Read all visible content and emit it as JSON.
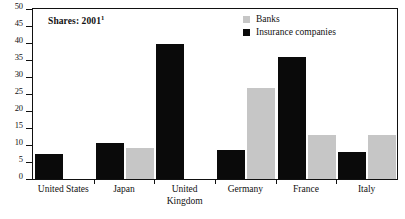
{
  "chart_data": {
    "type": "bar",
    "title": "Shares: 2001",
    "title_superscript": "1",
    "xlabel": "",
    "ylabel": "",
    "ylim": [
      0,
      50
    ],
    "ytick_step": 5,
    "yticks": [
      50,
      45,
      40,
      35,
      30,
      25,
      20,
      15,
      10,
      5,
      0
    ],
    "grid": false,
    "legend_position": "top-right",
    "categories": [
      "United States",
      "Japan",
      "United\nKingdom",
      "Germany",
      "France",
      "Italy"
    ],
    "series": [
      {
        "name": "Insurance companies",
        "color": "#0a0a0a",
        "values": [
          7.5,
          10.5,
          39.8,
          8.5,
          36.0,
          8.0
        ]
      },
      {
        "name": "Banks",
        "color": "#c6c6c6",
        "values": [
          null,
          9.0,
          null,
          26.7,
          13.0,
          13.0
        ]
      }
    ]
  },
  "legend": {
    "items": [
      {
        "label": "Banks",
        "swatch": "gray"
      },
      {
        "label": "Insurance companies",
        "swatch": "black"
      }
    ]
  }
}
